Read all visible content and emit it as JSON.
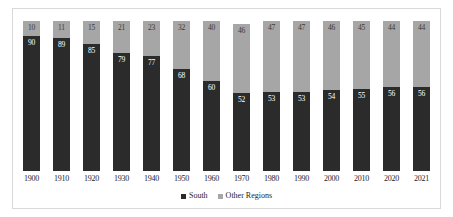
{
  "chart_data": {
    "type": "bar",
    "subtype": "stacked-percentage",
    "title": "",
    "xlabel": "",
    "ylabel": "",
    "ylim": [
      0,
      100
    ],
    "grid": false,
    "legend_position": "bottom-center",
    "categories": [
      "1900",
      "1910",
      "1920",
      "1930",
      "1940",
      "1950",
      "1960",
      "1970",
      "1980",
      "1990",
      "2000",
      "2010",
      "2020",
      "2021"
    ],
    "series": [
      {
        "name": "South",
        "color": "#2b2b2b",
        "values": [
          90,
          89,
          85,
          79,
          77,
          68,
          60,
          52,
          53,
          53,
          54,
          55,
          56,
          56
        ]
      },
      {
        "name": "Other Regions",
        "color": "#a6a6a6",
        "values": [
          10,
          11,
          15,
          21,
          23,
          32,
          40,
          46,
          47,
          47,
          46,
          45,
          44,
          44
        ]
      }
    ],
    "legend": [
      "South",
      "Other Regions"
    ]
  },
  "legend": {
    "items": [
      {
        "label": "South",
        "swatch": "south"
      },
      {
        "label": "Other Regions",
        "swatch": "other"
      }
    ]
  }
}
